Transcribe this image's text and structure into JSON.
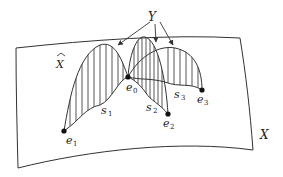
{
  "diagram": {
    "labels": {
      "Y": "Y",
      "X_hat": "X",
      "X": "X",
      "e0": {
        "base": "e",
        "sub": "0"
      },
      "e1": {
        "base": "e",
        "sub": "1"
      },
      "e2": {
        "base": "e",
        "sub": "2"
      },
      "e3": {
        "base": "e",
        "sub": "3"
      },
      "s1": {
        "base": "s",
        "sub": "1"
      },
      "s2": {
        "base": "s",
        "sub": "2"
      },
      "s3": {
        "base": "s",
        "sub": "3"
      }
    },
    "colors": {
      "stroke": "#333333",
      "hatch": "#444444",
      "point": "#111111",
      "background": "#ffffff"
    }
  }
}
